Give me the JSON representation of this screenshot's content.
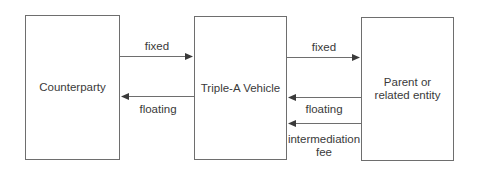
{
  "diagram": {
    "nodes": [
      {
        "id": "counterparty",
        "label": "Counterparty"
      },
      {
        "id": "vehicle",
        "label": "Triple-A Vehicle"
      },
      {
        "id": "parent",
        "label_line1": "Parent or",
        "label_line2": "related entity"
      }
    ],
    "edges": [
      {
        "from": "counterparty",
        "to": "vehicle",
        "label": "fixed"
      },
      {
        "from": "vehicle",
        "to": "counterparty",
        "label": "floating"
      },
      {
        "from": "vehicle",
        "to": "parent",
        "label": "fixed"
      },
      {
        "from": "parent",
        "to": "vehicle",
        "label": "floating"
      },
      {
        "from": "parent",
        "to": "vehicle",
        "label_line1": "intermediation",
        "label_line2": "fee"
      }
    ],
    "colors": {
      "stroke": "#6e6e6e",
      "arrow": "#3a3a3a",
      "text": "#3a3a3a"
    }
  }
}
